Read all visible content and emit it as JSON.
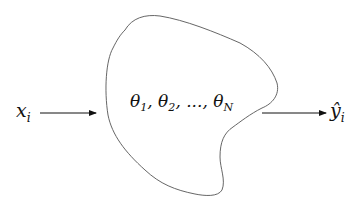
{
  "diagram": {
    "input": {
      "symbol": "x",
      "subscript": "i"
    },
    "output": {
      "symbol": "ŷ",
      "subscript": "i"
    },
    "parameters": {
      "items": [
        {
          "symbol": "θ",
          "subscript": "1"
        },
        {
          "symbol": "θ",
          "subscript": "2"
        },
        {
          "symbol": "θ",
          "subscript": "N"
        }
      ],
      "separator": ", ",
      "ellipsis": "...,"
    },
    "colors": {
      "stroke": "#555555",
      "text": "#111111",
      "background": "#ffffff"
    }
  }
}
